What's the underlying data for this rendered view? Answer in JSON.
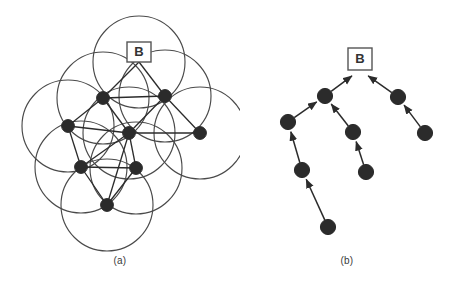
{
  "figure": {
    "background_color": "#ffffff",
    "ink_color": "#4a4a4a",
    "node_color": "#2b2b2b",
    "panels": [
      {
        "id": "a",
        "caption": "(a)",
        "kind": "coverage-disk-graph",
        "root_label": "B",
        "root_label_box": {
          "x": 139,
          "y": 52,
          "w": 24,
          "h": 20
        },
        "disk_radius": 46,
        "nodes": [
          {
            "id": "n1",
            "label": "",
            "x": 103,
            "y": 98
          },
          {
            "id": "n2",
            "label": "",
            "x": 165,
            "y": 96
          },
          {
            "id": "n3",
            "label": "",
            "x": 68,
            "y": 126
          },
          {
            "id": "n4",
            "label": "",
            "x": 129,
            "y": 133
          },
          {
            "id": "n5",
            "label": "",
            "x": 200,
            "y": 133
          },
          {
            "id": "n6",
            "label": "",
            "x": 81,
            "y": 167
          },
          {
            "id": "n7",
            "label": "",
            "x": 136,
            "y": 168
          },
          {
            "id": "n8",
            "label": "",
            "x": 107,
            "y": 205
          }
        ],
        "extra_disk_centers": [
          {
            "x": 139,
            "y": 62
          }
        ],
        "edges": [
          {
            "from": "n1",
            "to": "n2"
          },
          {
            "from": "n1",
            "to": "n3"
          },
          {
            "from": "n1",
            "to": "n4"
          },
          {
            "from": "n2",
            "to": "n4"
          },
          {
            "from": "n2",
            "to": "n5"
          },
          {
            "from": "n3",
            "to": "n4"
          },
          {
            "from": "n3",
            "to": "n6"
          },
          {
            "from": "n4",
            "to": "n5"
          },
          {
            "from": "n4",
            "to": "n6"
          },
          {
            "from": "n4",
            "to": "n7"
          },
          {
            "from": "n4",
            "to": "n8"
          },
          {
            "from": "n6",
            "to": "n7"
          },
          {
            "from": "n6",
            "to": "n8"
          },
          {
            "from": "n7",
            "to": "n8"
          },
          {
            "from": "n1",
            "to": "rootbox"
          },
          {
            "from": "n2",
            "to": "rootbox"
          }
        ]
      },
      {
        "id": "b",
        "caption": "(b)",
        "kind": "spanning-tree",
        "root_label": "B",
        "root_label_box": {
          "x": 360,
          "y": 59,
          "w": 24,
          "h": 22
        },
        "nodes": [
          {
            "id": "t1",
            "label": "",
            "x": 325,
            "y": 96
          },
          {
            "id": "t2",
            "label": "",
            "x": 398,
            "y": 97
          },
          {
            "id": "t3",
            "label": "",
            "x": 288,
            "y": 122
          },
          {
            "id": "t4",
            "label": "",
            "x": 353,
            "y": 132
          },
          {
            "id": "t5",
            "label": "",
            "x": 425,
            "y": 133
          },
          {
            "id": "t6",
            "label": "",
            "x": 302,
            "y": 170
          },
          {
            "id": "t7",
            "label": "",
            "x": 366,
            "y": 172
          },
          {
            "id": "t8",
            "label": "",
            "x": 328,
            "y": 227
          }
        ],
        "arrows": [
          {
            "from": "t1",
            "to": "root",
            "label": ""
          },
          {
            "from": "t2",
            "to": "root",
            "label": ""
          },
          {
            "from": "t3",
            "to": "t1",
            "label": ""
          },
          {
            "from": "t4",
            "to": "t1",
            "label": ""
          },
          {
            "from": "t5",
            "to": "t2",
            "label": ""
          },
          {
            "from": "t6",
            "to": "t3",
            "label": ""
          },
          {
            "from": "t7",
            "to": "t4",
            "label": ""
          },
          {
            "from": "t8",
            "to": "t6",
            "label": ""
          }
        ]
      }
    ]
  }
}
